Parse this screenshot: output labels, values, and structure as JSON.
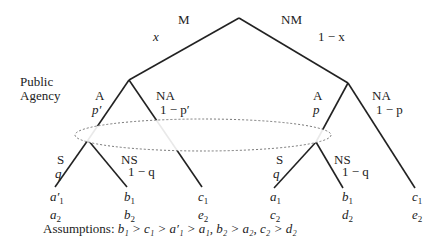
{
  "root": {
    "left_action": "M",
    "left_prob": "x",
    "right_action": "NM",
    "right_prob": "1 − x"
  },
  "player_label": [
    "Public",
    "Agency"
  ],
  "left_node": {
    "a_label": "A",
    "a_prob": "p′",
    "na_label": "NA",
    "na_prob": "1 − p′"
  },
  "right_node": {
    "a_label": "A",
    "a_prob": "p",
    "na_label": "NA",
    "na_prob": "1 − p"
  },
  "sub_left": {
    "s_label": "S",
    "s_prob": "q",
    "ns_label": "NS",
    "ns_prob": "1 − q"
  },
  "sub_right": {
    "s_label": "S",
    "s_prob": "q",
    "ns_label": "NS",
    "ns_prob": "1 − q"
  },
  "payoffs": [
    {
      "p1": "a",
      "p1s": "1",
      "p1prime": "′",
      "p2": "a",
      "p2s": "2"
    },
    {
      "p1": "b",
      "p1s": "1",
      "p1prime": "",
      "p2": "b",
      "p2s": "2"
    },
    {
      "p1": "c",
      "p1s": "1",
      "p1prime": "",
      "p2": "e",
      "p2s": "2"
    },
    {
      "p1": "a",
      "p1s": "1",
      "p1prime": "",
      "p2": "c",
      "p2s": "2"
    },
    {
      "p1": "b",
      "p1s": "1",
      "p1prime": "",
      "p2": "d",
      "p2s": "2"
    },
    {
      "p1": "c",
      "p1s": "1",
      "p1prime": "",
      "p2": "e",
      "p2s": "2"
    }
  ],
  "assumptions_label": "Assumptions:",
  "assumptions_text": "b₁ > c₁ > a′₁ > a₁, b₂ > a₂, c₂ > d₂"
}
